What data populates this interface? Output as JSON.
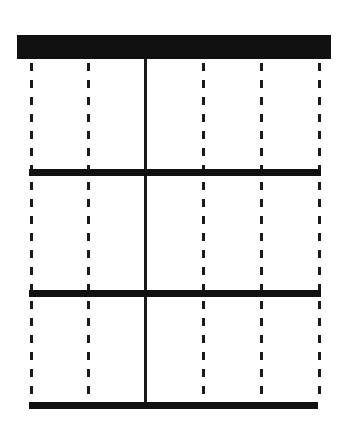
{
  "diagram": {
    "colors": {
      "line": "#1a1a1a",
      "top_bar": "#111111",
      "background": "#ffffff"
    },
    "top_bar": {
      "x": 17,
      "y": 35,
      "width": 314,
      "height": 24
    },
    "horizontal_rules": [
      {
        "x": 29,
        "y": 169,
        "width": 292,
        "height": 7
      },
      {
        "x": 29,
        "y": 290,
        "width": 292,
        "height": 7
      },
      {
        "x": 29,
        "y": 402,
        "width": 289,
        "height": 7
      }
    ],
    "vertical_lines": [
      {
        "x": 30,
        "style": "dashed"
      },
      {
        "x": 87,
        "style": "dashed"
      },
      {
        "x": 144,
        "style": "solid"
      },
      {
        "x": 202,
        "style": "dashed"
      },
      {
        "x": 260,
        "style": "dashed"
      },
      {
        "x": 318,
        "style": "dashed"
      }
    ],
    "vertical_span": {
      "top": 59,
      "bottom": 409
    },
    "dash_pattern": {
      "dash_length": 8,
      "gap": 9,
      "width": 3
    }
  }
}
